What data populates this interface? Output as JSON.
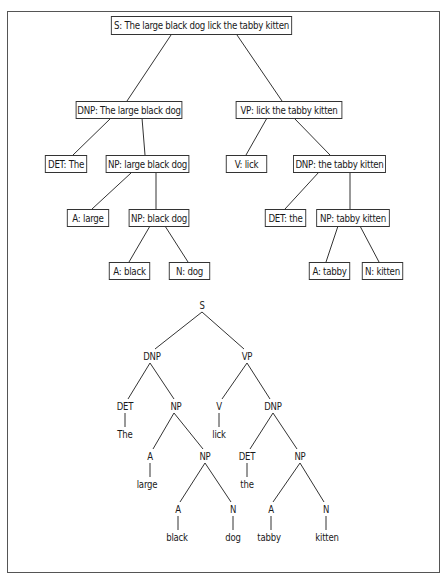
{
  "diagram": {
    "box_tree": {
      "nodes": [
        {
          "id": "s",
          "label": "S: The large black dog lick the tabby kitten"
        },
        {
          "id": "dnp1",
          "label": "DNP: The large black dog"
        },
        {
          "id": "vp",
          "label": "VP: lick the tabby kitten"
        },
        {
          "id": "det1",
          "label": "DET: The"
        },
        {
          "id": "np1",
          "label": "NP: large black dog"
        },
        {
          "id": "v",
          "label": "V: lick"
        },
        {
          "id": "dnp2",
          "label": "DNP: the tabby kitten"
        },
        {
          "id": "a1",
          "label": "A: large"
        },
        {
          "id": "np2",
          "label": "NP: black dog"
        },
        {
          "id": "det2",
          "label": "DET: the"
        },
        {
          "id": "np3",
          "label": "NP: tabby kitten"
        },
        {
          "id": "a2",
          "label": "A: black"
        },
        {
          "id": "n1",
          "label": "N: dog"
        },
        {
          "id": "a3",
          "label": "A: tabby"
        },
        {
          "id": "n2",
          "label": "N: kitten"
        }
      ]
    },
    "line_tree": {
      "nodes": [
        {
          "id": "s",
          "label": "S"
        },
        {
          "id": "dnp1",
          "label": "DNP"
        },
        {
          "id": "vp",
          "label": "VP"
        },
        {
          "id": "det1",
          "label": "DET"
        },
        {
          "id": "np1",
          "label": "NP"
        },
        {
          "id": "v",
          "label": "V"
        },
        {
          "id": "dnp2",
          "label": "DNP"
        },
        {
          "id": "w_the1",
          "label": "The"
        },
        {
          "id": "w_lick",
          "label": "lick"
        },
        {
          "id": "a1",
          "label": "A"
        },
        {
          "id": "np2",
          "label": "NP"
        },
        {
          "id": "det2",
          "label": "DET"
        },
        {
          "id": "np3",
          "label": "NP"
        },
        {
          "id": "w_large",
          "label": "large"
        },
        {
          "id": "w_the2",
          "label": "the"
        },
        {
          "id": "a2",
          "label": "A"
        },
        {
          "id": "n1",
          "label": "N"
        },
        {
          "id": "a3",
          "label": "A"
        },
        {
          "id": "n2",
          "label": "N"
        },
        {
          "id": "w_black",
          "label": "black"
        },
        {
          "id": "w_dog",
          "label": "dog"
        },
        {
          "id": "w_tabby",
          "label": "tabby"
        },
        {
          "id": "w_kitten",
          "label": "kitten"
        }
      ]
    }
  }
}
